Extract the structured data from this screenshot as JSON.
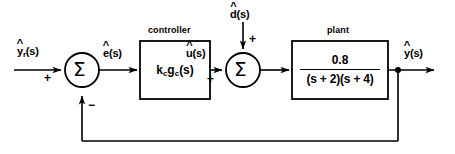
{
  "diagram": {
    "background_color": "#ffffff",
    "line_color": "#000000"
  },
  "signals": {
    "reference": {
      "base": "y",
      "hat": "^",
      "subscript": "r",
      "suffix": "(s)",
      "text": "ŷr(s)"
    },
    "error": {
      "base": "e",
      "hat": "^",
      "subscript": "",
      "suffix": "(s)",
      "text": "ê(s)"
    },
    "control": {
      "base": "u",
      "hat": "^",
      "subscript": "",
      "suffix": "(s)",
      "text": "û(s)"
    },
    "disturbance": {
      "base": "d",
      "hat": "^",
      "subscript": "",
      "suffix": "(s)",
      "text": "d̂(s)"
    },
    "output": {
      "base": "y",
      "hat": "^",
      "subscript": "",
      "suffix": "(s)",
      "text": "ŷ(s)"
    }
  },
  "summers": {
    "first": {
      "symbol": "Σ",
      "reference_sign": "+",
      "feedback_sign": "−"
    },
    "second": {
      "symbol": "Σ",
      "control_sign": "+",
      "disturbance_sign": "+"
    }
  },
  "blocks": {
    "controller": {
      "label": "controller",
      "gain": "k",
      "gain_subscript": "c",
      "transfer": "g",
      "transfer_subscript": "c",
      "transfer_arg": "(s)",
      "expression": "kcgc(s)"
    },
    "plant": {
      "label": "plant",
      "numerator": "0.8",
      "denominator": "(s + 2)(s + 4)",
      "expression": "0.8 / (s + 2)(s + 4)"
    }
  }
}
